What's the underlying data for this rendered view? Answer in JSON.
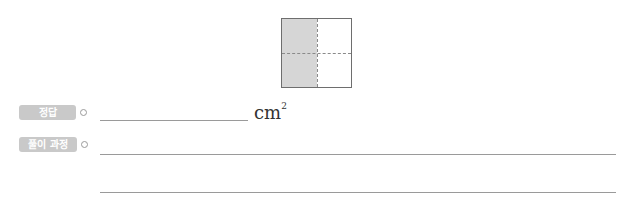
{
  "figure": {
    "shade_color": "#d6d6d6",
    "border_color": "#6e6e6e"
  },
  "answer": {
    "label": "정답",
    "unit": "cm",
    "unit_exponent": "2",
    "value": ""
  },
  "solution": {
    "label": "풀이 과정",
    "lines": [
      "",
      ""
    ]
  },
  "colors": {
    "tag_bg": "#c9c9c9",
    "line": "#9a9a9a"
  }
}
